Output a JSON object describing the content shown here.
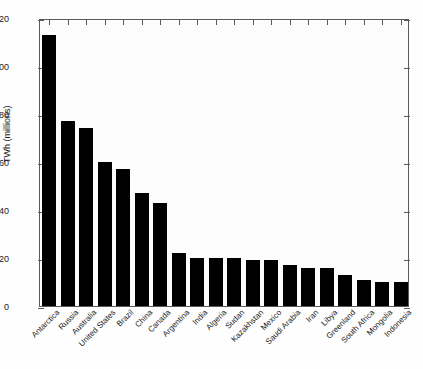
{
  "chart_data": {
    "type": "bar",
    "title": "",
    "subtitle": "",
    "xlabel": "",
    "ylabel": "TWh (millions)",
    "ylim": [
      0,
      120
    ],
    "yticks": [
      0,
      20,
      40,
      60,
      80,
      100,
      120
    ],
    "ytick_labels": [
      "0",
      "20",
      "40",
      "60",
      "80",
      "100",
      "120"
    ],
    "grid": false,
    "legend": false,
    "legend_position": "none",
    "bar_color": "#000000",
    "categories": [
      "Antarctica",
      "Russia",
      "Australia",
      "United States",
      "Brazil",
      "China",
      "Canada",
      "Argentina",
      "India",
      "Algeria",
      "Sudan",
      "Kazakhstan",
      "Mexico",
      "Saudi Arabia",
      "Iran",
      "Libya",
      "Greenland",
      "South Africa",
      "Mongolia",
      "Indonesia"
    ],
    "values": [
      113,
      77,
      74,
      60,
      57,
      47,
      43,
      22,
      20,
      20,
      20,
      19,
      19,
      17,
      16,
      16,
      13,
      11,
      10,
      10
    ]
  },
  "axes": {
    "y_title": "TWh (millions)"
  }
}
